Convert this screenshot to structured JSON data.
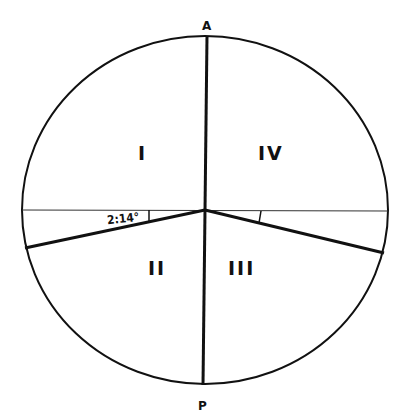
{
  "diagram": {
    "axis_labels": {
      "top": "A",
      "bottom": "P"
    },
    "quadrants": [
      {
        "id": "I",
        "label": "I"
      },
      {
        "id": "II",
        "label": "II"
      },
      {
        "id": "III",
        "label": "III"
      },
      {
        "id": "IV",
        "label": "IV"
      }
    ],
    "angle_label": "2:14°",
    "colors": {
      "line": "#111111",
      "background": "#ffffff"
    }
  }
}
